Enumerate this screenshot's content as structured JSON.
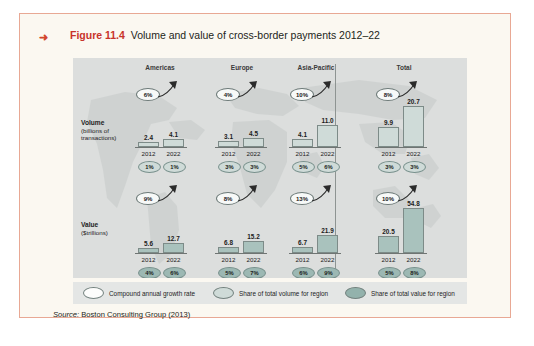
{
  "figure": {
    "marker_icon": "right-arrow-icon",
    "number": "Figure 11.4",
    "caption": "Volume and value of cross-border payments 2012–22",
    "source_prefix": "Source:",
    "source_text": " Boston Consulting Group (2013)"
  },
  "colors": {
    "accent_red": "#c8332a",
    "page_border": "#e8a894",
    "page_bg": "#fbf8f1",
    "panel_bg": "#dcdedd",
    "legend_bg": "#e4e6e5",
    "bar_volume": "#cfdbd8",
    "bar_value": "#a9c2bd",
    "share_volume": "#cfdbd8",
    "share_value": "#9cb8b3",
    "cagr_bubble": "#f7f9f8",
    "axis": "#6f7573"
  },
  "columns": [
    {
      "label": "Americas"
    },
    {
      "label": "Europe"
    },
    {
      "label": "Asia-Pacific"
    },
    {
      "label": "Total"
    }
  ],
  "rows": [
    {
      "title": "Volume",
      "unit_line1": "(billions of",
      "unit_line2": "transactions)"
    },
    {
      "title": "Value",
      "unit_line1": "($trillions)",
      "unit_line2": ""
    }
  ],
  "legend": [
    {
      "swatch": "white",
      "label": "Compound annual growth rate"
    },
    {
      "swatch": "ltteal",
      "label": "Share of total volume for region"
    },
    {
      "swatch": "dkteal",
      "label": "Share of total value for region"
    }
  ],
  "years": {
    "start": "2012",
    "end": "2022"
  },
  "chart_data": {
    "type": "bar",
    "title": "Volume and value of cross-border payments 2012–22",
    "subtitle": "",
    "xlabel": "",
    "ylabel": "",
    "grid": false,
    "legend_position": "bottom",
    "categories": [
      "2012",
      "2022"
    ],
    "regions": [
      "Americas",
      "Europe",
      "Asia-Pacific",
      "Total"
    ],
    "panels": [
      {
        "metric": "Volume",
        "unit": "billions of transactions",
        "ylim": [
          0,
          22
        ],
        "groups": [
          {
            "region": "Americas",
            "values": [
              2.4,
              4.1
            ],
            "value_labels": [
              "2.4",
              "4.1"
            ],
            "cagr": "6%",
            "shares": [
              "1%",
              "1%"
            ]
          },
          {
            "region": "Europe",
            "values": [
              3.1,
              4.5
            ],
            "value_labels": [
              "3.1",
              "4.5"
            ],
            "cagr": "4%",
            "shares": [
              "3%",
              "3%"
            ]
          },
          {
            "region": "Asia-Pacific",
            "values": [
              4.1,
              11.0
            ],
            "value_labels": [
              "4.1",
              "11.0"
            ],
            "cagr": "10%",
            "shares": [
              "5%",
              "6%"
            ]
          },
          {
            "region": "Total",
            "values": [
              9.9,
              20.7
            ],
            "value_labels": [
              "9.9",
              "20.7"
            ],
            "cagr": "8%",
            "shares": [
              "3%",
              "3%"
            ]
          }
        ]
      },
      {
        "metric": "Value",
        "unit": "$trillions",
        "ylim": [
          0,
          56
        ],
        "groups": [
          {
            "region": "Americas",
            "values": [
              5.6,
              12.7
            ],
            "value_labels": [
              "5.6",
              "12.7"
            ],
            "cagr": "9%",
            "shares": [
              "4%",
              "6%"
            ]
          },
          {
            "region": "Europe",
            "values": [
              6.8,
              15.2
            ],
            "value_labels": [
              "6.8",
              "15.2"
            ],
            "cagr": "8%",
            "shares": [
              "5%",
              "7%"
            ]
          },
          {
            "region": "Asia-Pacific",
            "values": [
              6.7,
              21.9
            ],
            "value_labels": [
              "6.7",
              "21.9"
            ],
            "cagr": "13%",
            "shares": [
              "6%",
              "9%"
            ]
          },
          {
            "region": "Total",
            "values": [
              20.5,
              54.8
            ],
            "value_labels": [
              "20.5",
              "54.8"
            ],
            "cagr": "10%",
            "shares": [
              "5%",
              "8%"
            ]
          }
        ]
      }
    ],
    "legend_entries": [
      "Compound annual growth rate",
      "Share of total volume for region",
      "Share of total value for region"
    ],
    "source": "Boston Consulting Group (2013)"
  }
}
